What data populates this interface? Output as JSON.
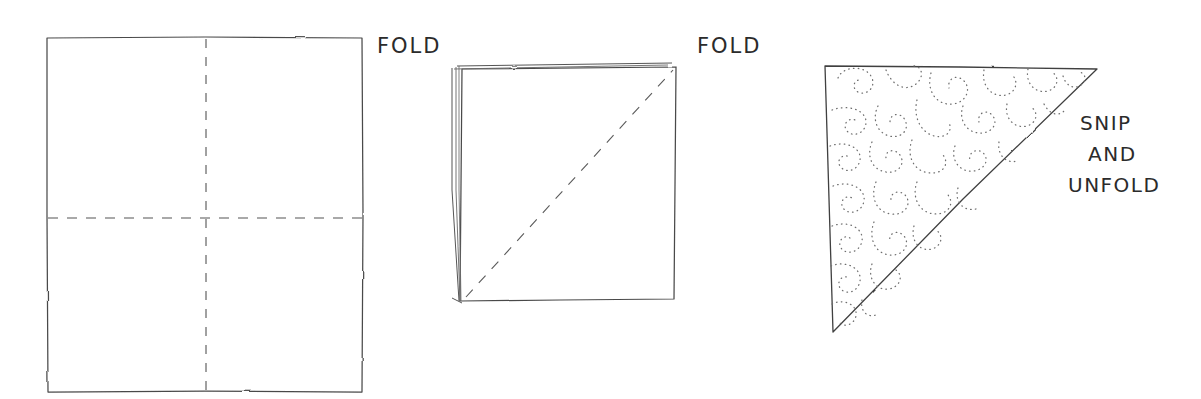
{
  "canvas": {
    "width": 1201,
    "height": 399,
    "background": "#ffffff",
    "ink": "#2b2b2b",
    "title": "Paper folding and snipping instructions"
  },
  "labels": {
    "fold_1": "FOLD",
    "fold_2": "FOLD",
    "snip_line_1": "SNIP",
    "snip_line_2": "AND",
    "snip_line_3": "UNFOLD"
  },
  "figures": [
    {
      "id": "flat-square",
      "name": "unfolded-square-with-fold-creases",
      "description": "Full square sheet with vertical and horizontal dashed crease lines dividing it into four quadrants",
      "bounds": {
        "x": 47,
        "y": 38,
        "width": 315,
        "height": 354
      },
      "creases": [
        {
          "orientation": "vertical",
          "position": 206,
          "style": "dashed"
        },
        {
          "orientation": "horizontal",
          "position": 218,
          "style": "dashed"
        }
      ]
    },
    {
      "id": "folded-square",
      "name": "quarter-folded-square-with-diagonal-crease",
      "description": "Square folded into quarters showing stacked paper layers along the left edge and top edge, with a dashed diagonal crease from bottom-left to top-right",
      "bounds": {
        "x": 452,
        "y": 62,
        "width": 224,
        "height": 240
      },
      "layer_count": 4,
      "creases": [
        {
          "orientation": "diagonal",
          "from": "bottom-left",
          "to": "top-right",
          "style": "dashed"
        }
      ]
    },
    {
      "id": "snipped-triangle",
      "name": "folded-triangle-with-snip-pattern",
      "description": "Right triangle (folded stack) covered with dotted hook and paisley shapes marking where to snip",
      "bounds": {
        "x": 825,
        "y": 66,
        "width": 272,
        "height": 266
      },
      "vertices": [
        {
          "x": 825,
          "y": 66
        },
        {
          "x": 1097,
          "y": 69
        },
        {
          "x": 833,
          "y": 332
        }
      ],
      "pattern": "dotted-hook-swirls"
    }
  ],
  "steps": [
    {
      "order": 1,
      "figure": "flat-square",
      "instruction": "FOLD"
    },
    {
      "order": 2,
      "figure": "folded-square",
      "instruction": "FOLD"
    },
    {
      "order": 3,
      "figure": "snipped-triangle",
      "instruction": "SNIP AND UNFOLD"
    }
  ]
}
